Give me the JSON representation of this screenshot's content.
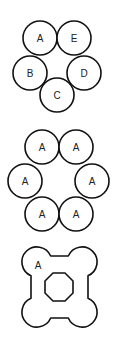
{
  "figures": [
    {
      "id": "five-circle-ring",
      "circles": [
        {
          "label": "A",
          "cx": 40,
          "cy": 38,
          "r": 17
        },
        {
          "label": "E",
          "cx": 74,
          "cy": 38,
          "r": 17
        },
        {
          "label": "B",
          "cx": 30,
          "cy": 73,
          "r": 17
        },
        {
          "label": "D",
          "cx": 84,
          "cy": 73,
          "r": 17
        },
        {
          "label": "C",
          "cx": 57,
          "cy": 95,
          "r": 17
        }
      ]
    },
    {
      "id": "six-circle-ring",
      "circles": [
        {
          "label": "A",
          "cx": 42,
          "cy": 147,
          "r": 17
        },
        {
          "label": "A",
          "cx": 76,
          "cy": 147,
          "r": 17
        },
        {
          "label": "A",
          "cx": 25,
          "cy": 181,
          "r": 17
        },
        {
          "label": "A",
          "cx": 92,
          "cy": 181,
          "r": 17
        },
        {
          "label": "A",
          "cx": 42,
          "cy": 214,
          "r": 17
        },
        {
          "label": "A",
          "cx": 76,
          "cy": 214,
          "r": 17
        }
      ]
    },
    {
      "id": "merged-region",
      "label": "A",
      "label_pos": {
        "x": 38,
        "y": 265
      },
      "stroke": "#111111"
    }
  ],
  "colors": {
    "background": "#ffffff",
    "stroke": "#111111",
    "text": "#222222"
  }
}
